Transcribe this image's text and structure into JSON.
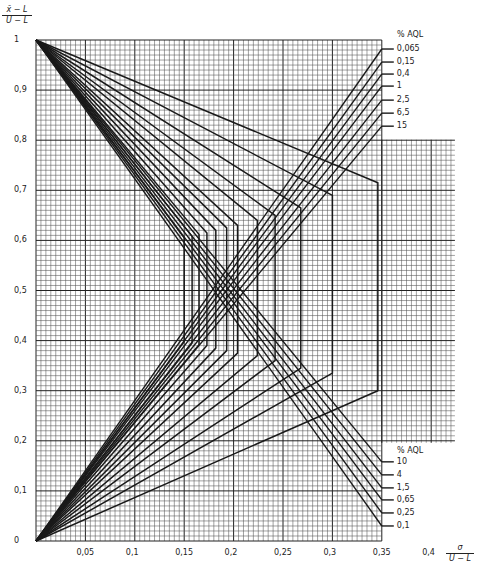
{
  "chart_data": {
    "type": "line",
    "title": "",
    "xlabel": "σ / (U−L)",
    "ylabel": "(x̄−L) / (U−L)",
    "xlim": [
      0,
      0.35
    ],
    "ylim": [
      0,
      1
    ],
    "grid": true,
    "x_ticks": [
      "0,05",
      "0,1",
      "0,15",
      "0,2",
      "0,25",
      "0,3",
      "0,35",
      "0,4"
    ],
    "x_tick_values": [
      0.05,
      0.1,
      0.15,
      0.2,
      0.25,
      0.3,
      0.35,
      0.4
    ],
    "y_ticks": [
      "0",
      "0,1",
      "0,2",
      "0,3",
      "0,4",
      "0,5",
      "0,6",
      "0,7",
      "0,8",
      "0,9",
      "1"
    ],
    "y_tick_values": [
      0,
      0.1,
      0.2,
      0.3,
      0.4,
      0.5,
      0.6,
      0.7,
      0.8,
      0.9,
      1
    ],
    "legend_upper": {
      "title": "% AQL",
      "entries": [
        "0,065",
        "0,15",
        "0,4",
        "1",
        "2,5",
        "6,5",
        "15"
      ],
      "y_at_right_edge": [
        0.982,
        0.956,
        0.932,
        0.908,
        0.88,
        0.854,
        0.828
      ]
    },
    "legend_lower": {
      "title": "% AQL",
      "entries": [
        "10",
        "4",
        "1,5",
        "0,65",
        "0,25",
        "0,1"
      ],
      "y_at_right_edge": [
        0.158,
        0.132,
        0.106,
        0.082,
        0.056,
        0.03
      ]
    },
    "acceptance_polygons": [
      {
        "x": 0.346,
        "y_top": 0.715,
        "y_bottom": 0.3
      },
      {
        "x": 0.3,
        "y_top": 0.69,
        "y_bottom": 0.335
      },
      {
        "x": 0.268,
        "y_top": 0.665,
        "y_bottom": 0.345
      },
      {
        "x": 0.242,
        "y_top": 0.65,
        "y_bottom": 0.36
      },
      {
        "x": 0.224,
        "y_top": 0.64,
        "y_bottom": 0.37
      },
      {
        "x": 0.204,
        "y_top": 0.63,
        "y_bottom": 0.375
      },
      {
        "x": 0.193,
        "y_top": 0.625,
        "y_bottom": 0.38
      },
      {
        "x": 0.182,
        "y_top": 0.62,
        "y_bottom": 0.385
      },
      {
        "x": 0.173,
        "y_top": 0.615,
        "y_bottom": 0.39
      },
      {
        "x": 0.165,
        "y_top": 0.612,
        "y_bottom": 0.392
      },
      {
        "x": 0.158,
        "y_top": 0.608,
        "y_bottom": 0.395
      },
      {
        "x": 0.15,
        "y_top": 0.605,
        "y_bottom": 0.398
      }
    ],
    "extended_grid": {
      "x_from": 0.35,
      "x_to": 0.424,
      "y_from": 0.196,
      "y_to": 0.801
    }
  },
  "labels": {
    "y_axis_num": "x̄ − L",
    "y_axis_den": "U − L",
    "x_axis_num": "σ",
    "x_axis_den": "U − L",
    "legend_upper_title": "% AQL",
    "legend_lower_title": "% AQL"
  },
  "style": {
    "line_color": "#1a1a1a",
    "grid_minor": "#555555",
    "grid_major": "#222222",
    "background": "#ffffff"
  }
}
